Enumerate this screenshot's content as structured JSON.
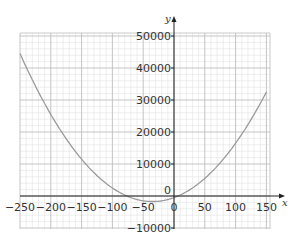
{
  "chart_data": {
    "type": "line",
    "title": "",
    "xlabel": "x",
    "ylabel": "y",
    "xlim": [
      -250,
      155
    ],
    "ylim": [
      -10000,
      51000
    ],
    "grid": true,
    "x_ticks": [
      -250,
      -200,
      -150,
      -100,
      -50,
      0,
      50,
      100,
      150
    ],
    "x_tick_labels": [
      "-250",
      "-200",
      "-150",
      "-100",
      "-50",
      "0",
      "50",
      "100",
      "150"
    ],
    "y_ticks": [
      -10000,
      0,
      10000,
      20000,
      30000,
      40000,
      50000
    ],
    "y_tick_labels": [
      "-10000",
      "0",
      "10000",
      "20000",
      "30000",
      "40000",
      "50000"
    ],
    "series": [
      {
        "name": "y = x^2 + 70x - 500",
        "color": "#9a9a9a",
        "x": [
          -250,
          -225,
          -200,
          -175,
          -150,
          -125,
          -100,
          -75,
          -50,
          -35,
          -25,
          0,
          25,
          50,
          75,
          100,
          125,
          150
        ],
        "values": [
          44500,
          34375,
          25500,
          17875,
          11500,
          6375,
          2500,
          -125,
          -1500,
          -1725,
          -1625,
          -500,
          1875,
          5500,
          10375,
          16500,
          23875,
          32500
        ]
      }
    ]
  },
  "colors": {
    "grid_major": "#bdbdbd",
    "grid_minor": "#e2e2e2",
    "axis": "#222222",
    "curve": "#9a9a9a"
  }
}
